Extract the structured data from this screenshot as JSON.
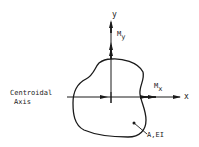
{
  "diagram": {
    "y_axis_label": "y",
    "x_axis_label": "x",
    "moment_y_label": "M",
    "moment_y_sub": "y",
    "moment_x_label": "M",
    "moment_x_sub": "x",
    "centroidal_axis_line1": "Centroidal",
    "centroidal_axis_line2": "Axis",
    "section_label": "A,EI",
    "stroke_color": "#1a1a1a"
  }
}
